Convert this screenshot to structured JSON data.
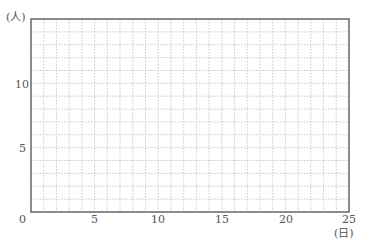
{
  "chart_data": {
    "type": "line",
    "title": "",
    "xlabel": "(日)",
    "ylabel": "(人)",
    "xlim": [
      0,
      25
    ],
    "ylim": [
      0,
      15
    ],
    "x_ticks": [
      0,
      5,
      10,
      15,
      20,
      25
    ],
    "y_ticks": [
      0,
      5,
      10
    ],
    "x_tick_labels": [
      "0",
      "5",
      "10",
      "15",
      "20",
      "25"
    ],
    "y_tick_labels": [
      "5",
      "10"
    ],
    "origin_label": "0",
    "grid": true,
    "grid_step_x": 1,
    "grid_step_y": 1,
    "series": []
  },
  "style": {
    "border_color": "#666666",
    "grid_color": "#bbbbbb"
  }
}
